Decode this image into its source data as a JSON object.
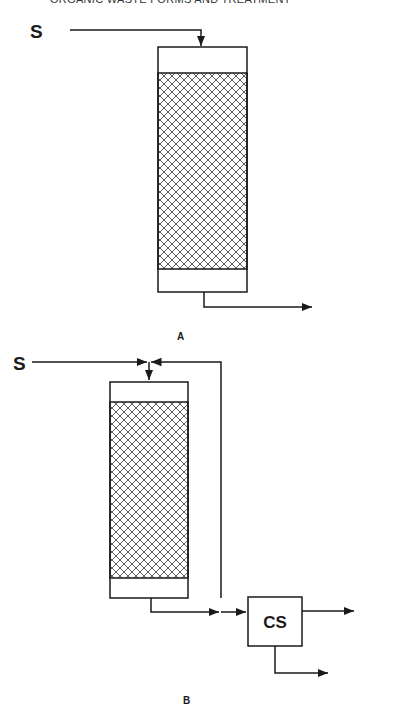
{
  "header": {
    "text": "ORGANIC WASTE FORMS AND TREATMENT"
  },
  "diagram_a": {
    "caption": "A",
    "inlet_label": "S"
  },
  "diagram_b": {
    "caption": "B",
    "inlet_label": "S",
    "separator_label": "CS"
  },
  "colors": {
    "line": "#1a1a1a",
    "background": "#ffffff"
  }
}
